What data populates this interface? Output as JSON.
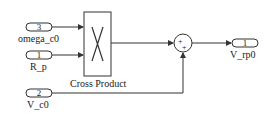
{
  "diagram": {
    "inports": [
      {
        "number": "3",
        "name": "omega_c0"
      },
      {
        "number": "1",
        "name": "R_p"
      },
      {
        "number": "2",
        "name": "V_c0"
      }
    ],
    "blocks": {
      "cross_product": {
        "label": "Cross Product",
        "symbol": "X"
      },
      "sum": {
        "signs": [
          "+",
          "+"
        ]
      }
    },
    "outports": [
      {
        "number": "1",
        "name": "V_rp0"
      }
    ],
    "colors": {
      "line": "#333333",
      "background": "#ffffff"
    }
  }
}
